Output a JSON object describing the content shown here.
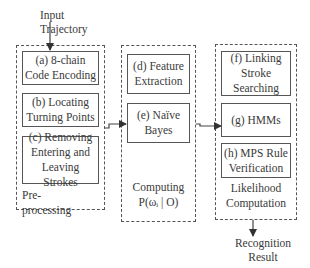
{
  "input_label": "Input\nTrajectory",
  "output_label": "Recognition\nResult",
  "groups": [
    {
      "caption": "Pre-processing",
      "boxes": [
        {
          "label": "(a) 8-chain\nCode Encoding"
        },
        {
          "label": "(b) Locating\nTurning Points"
        },
        {
          "label": "(c) Removing\nEntering and\nLeaving Strokes"
        }
      ]
    },
    {
      "caption": "Computing\nP(ωᵢ | O)",
      "boxes": [
        {
          "label": "(d) Feature\nExtraction"
        },
        {
          "label": "(e) Naïve\nBayes"
        }
      ]
    },
    {
      "caption": "Likelihood\nComputation",
      "boxes": [
        {
          "label": "(f)  Linking\nStroke\nSearching"
        },
        {
          "label": "(g) HMMs"
        },
        {
          "label": "(h) MPS Rule\nVerification"
        }
      ]
    }
  ],
  "colors": {
    "line": "#555555",
    "text": "#3a3a3a"
  }
}
